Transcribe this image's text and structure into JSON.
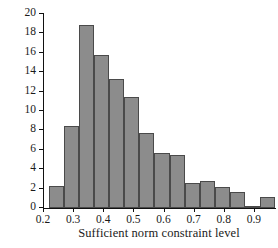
{
  "chart_data": {
    "type": "bar",
    "title": "",
    "subtitle": "",
    "xlabel": "Sufficient norm constraint level",
    "ylabel": "Percent of realizations",
    "grid": false,
    "legend": null,
    "legend_position": "none",
    "bar_color": "#8c8c8c",
    "bar_edge_color": "#4a4a4a",
    "axis_color": "#111111",
    "background_color": "#ffffff",
    "xlim": [
      0.2,
      0.97
    ],
    "ylim": [
      0,
      20
    ],
    "bin_width": 0.05,
    "x_tick_labels": [
      "0.2",
      "0.3",
      "0.4",
      "0.5",
      "0.6",
      "0.7",
      "0.8",
      "0.9"
    ],
    "x_tick_values": [
      0.2,
      0.3,
      0.4,
      0.5,
      0.6,
      0.7,
      0.8,
      0.9
    ],
    "y_tick_labels": [
      "0",
      "2",
      "4",
      "6",
      "8",
      "10",
      "12",
      "14",
      "16",
      "18",
      "20"
    ],
    "y_tick_values": [
      0,
      2,
      4,
      6,
      8,
      10,
      12,
      14,
      16,
      18,
      20
    ],
    "bin_edges": [
      0.22,
      0.27,
      0.32,
      0.37,
      0.42,
      0.47,
      0.52,
      0.57,
      0.62,
      0.67,
      0.72,
      0.77,
      0.82,
      0.87,
      0.92,
      0.97
    ],
    "bin_centers": [
      0.245,
      0.295,
      0.345,
      0.395,
      0.445,
      0.495,
      0.545,
      0.595,
      0.645,
      0.695,
      0.745,
      0.795,
      0.845,
      0.895,
      0.945
    ],
    "categories": [
      "0.22-0.27",
      "0.27-0.32",
      "0.32-0.37",
      "0.37-0.42",
      "0.42-0.47",
      "0.47-0.52",
      "0.52-0.57",
      "0.57-0.62",
      "0.62-0.67",
      "0.67-0.72",
      "0.72-0.77",
      "0.77-0.82",
      "0.82-0.87",
      "0.87-0.92",
      "0.92-0.97"
    ],
    "values": [
      2.3,
      8.5,
      18.9,
      15.8,
      13.3,
      11.4,
      7.7,
      5.7,
      5.5,
      2.6,
      2.8,
      2.2,
      1.7,
      0.2,
      1.1
    ]
  }
}
